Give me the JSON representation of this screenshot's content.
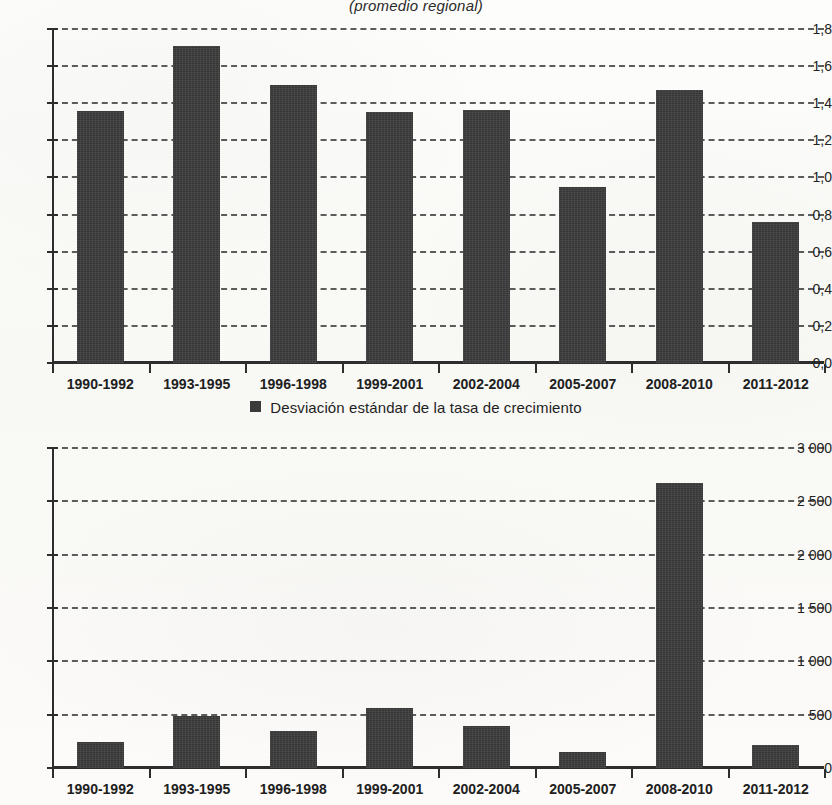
{
  "subtitle": "(promedio regional)",
  "legend": {
    "marker": "square-marker",
    "label": "Desviación estándar de la tasa de crecimiento"
  },
  "colors": {
    "bar": "#3b3b3b",
    "axis": "#2d2d2d",
    "grid": "#3a3a3a",
    "page": "#fbfbf9"
  },
  "chart_data": [
    {
      "type": "bar",
      "title": "(promedio regional)",
      "panel": "top",
      "xlabel": "",
      "ylabel": "",
      "ylim": [
        0.0,
        1.8
      ],
      "ytick_values": [
        0.0,
        0.2,
        0.4,
        0.6,
        0.8,
        1.0,
        1.2,
        1.4,
        1.6,
        1.8
      ],
      "ytick_labels": [
        "0,0",
        "0,2",
        "0,4",
        "0,6",
        "0,8",
        "1,0",
        "1,2",
        "1,4",
        "1,6",
        "1,8"
      ],
      "grid": true,
      "legend_position": "below",
      "categories": [
        "1990-1992",
        "1993-1995",
        "1996-1998",
        "1999-2001",
        "2002-2004",
        "2005-2007",
        "2008-2010",
        "2011-2012"
      ],
      "values": [
        1.36,
        1.71,
        1.5,
        1.355,
        1.365,
        0.95,
        1.47,
        0.76
      ],
      "series": [
        {
          "name": "Desviación estándar de la tasa de crecimiento",
          "values": [
            1.36,
            1.71,
            1.5,
            1.355,
            1.365,
            0.95,
            1.47,
            0.76
          ]
        }
      ]
    },
    {
      "type": "bar",
      "title": "",
      "panel": "bottom",
      "xlabel": "",
      "ylabel": "",
      "ylim": [
        0,
        3000
      ],
      "ytick_values": [
        0,
        500,
        1000,
        1500,
        2000,
        2500,
        3000
      ],
      "ytick_labels": [
        "0",
        "500",
        "1 000",
        "1 500",
        "2 000",
        "2 500",
        "3 000"
      ],
      "grid": true,
      "legend_position": "above",
      "categories": [
        "1990-1992",
        "1993-1995",
        "1996-1998",
        "1999-2001",
        "2002-2004",
        "2005-2007",
        "2008-2010",
        "2011-2012"
      ],
      "values": [
        240,
        490,
        345,
        560,
        390,
        150,
        2670,
        215
      ],
      "series": [
        {
          "name": "Desviación estándar de la tasa de crecimiento",
          "values": [
            240,
            490,
            345,
            560,
            390,
            150,
            2670,
            215
          ]
        }
      ]
    }
  ]
}
